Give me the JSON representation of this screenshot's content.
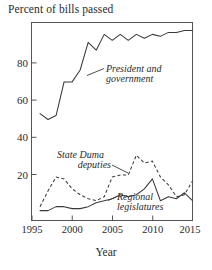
{
  "chart_data": {
    "type": "line",
    "title": "Percent of bills passed",
    "xlabel": "Year",
    "ylabel": "",
    "xlim": [
      1995,
      2015
    ],
    "ylim": [
      0,
      100
    ],
    "grid": false,
    "legend_position": "inline-annotations",
    "xticks": [
      "1995",
      "2000",
      "2005",
      "2010",
      "2015"
    ],
    "xtick_values": [
      1995,
      2000,
      2005,
      2010,
      2015
    ],
    "yticks": [
      "20",
      "40",
      "60",
      "80"
    ],
    "ytick_values": [
      20,
      40,
      60,
      80
    ],
    "x": [
      1996,
      1997,
      1998,
      1999,
      2000,
      2001,
      2002,
      2003,
      2004,
      2005,
      2006,
      2007,
      2008,
      2009,
      2010,
      2011,
      2012,
      2013,
      2014,
      2015
    ],
    "series": [
      {
        "name": "President and government",
        "style": "solid",
        "values": [
          54,
          51,
          53,
          70,
          70,
          76,
          90,
          86,
          94,
          91,
          94,
          91,
          94,
          92,
          94,
          93,
          95,
          95,
          96,
          96
        ]
      },
      {
        "name": "State Duma deputies",
        "style": "dashed",
        "values": [
          7,
          15,
          22,
          21,
          16,
          13,
          11,
          10,
          12,
          22,
          23,
          23,
          33,
          29,
          30,
          22,
          18,
          12,
          13,
          20
        ]
      },
      {
        "name": "Regional legislatures",
        "style": "solid",
        "values": [
          5,
          5,
          7,
          7,
          6,
          6,
          7,
          9,
          10,
          11,
          13,
          12,
          13,
          16,
          21,
          10,
          12,
          11,
          14,
          10
        ]
      }
    ],
    "annotations": [
      {
        "text_line1": "President and",
        "text_line2": "government",
        "points_to_series": "President and government"
      },
      {
        "text_line1": "State Duma",
        "text_line2": "deputies",
        "points_to_series": "State Duma deputies"
      },
      {
        "text_line1": "Regional",
        "text_line2": "legislatures",
        "points_to_series": "Regional legislatures"
      }
    ],
    "colors": {
      "line": "#3a3a3a",
      "axis": "#555555",
      "text": "#2a2a2a",
      "background": "#ffffff"
    }
  }
}
